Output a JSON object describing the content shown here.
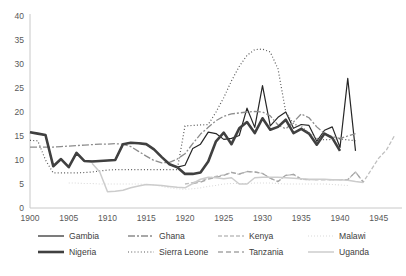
{
  "chart_data": {
    "type": "line",
    "title": "",
    "xlabel": "",
    "ylabel": "",
    "xlim": [
      1900,
      1948
    ],
    "ylim": [
      0,
      40
    ],
    "grid": false,
    "legend_position": "bottom",
    "xticks": [
      1900,
      1905,
      1910,
      1915,
      1920,
      1925,
      1930,
      1935,
      1940,
      1945
    ],
    "yticks": [
      0,
      5,
      10,
      15,
      20,
      25,
      30,
      35,
      40
    ],
    "series": [
      {
        "name": "Gambia",
        "color": "#262626",
        "width": 1.2,
        "dash": "",
        "x": [
          1900,
          1901,
          1902,
          1903,
          1904,
          1905,
          1906,
          1907,
          1908,
          1909,
          1910,
          1911,
          1912,
          1913,
          1914,
          1915,
          1916,
          1917,
          1918,
          1919,
          1920,
          1921,
          1922,
          1923,
          1924,
          1925,
          1926,
          1927,
          1928,
          1929,
          1930,
          1931,
          1932,
          1933,
          1934,
          1935,
          1936,
          1937,
          1938,
          1939,
          1940,
          1941,
          1942
        ],
        "values": [
          15.8,
          15.5,
          15.2,
          8.7,
          10.2,
          8.5,
          11.5,
          9.8,
          9.7,
          9.8,
          9.9,
          10.0,
          13.3,
          13.6,
          13.5,
          13.3,
          12.2,
          10.6,
          9.1,
          8.5,
          8.9,
          12.4,
          13.3,
          15.8,
          15.5,
          14.3,
          14.5,
          15.1,
          20.8,
          16.8,
          25.5,
          17.1,
          18.9,
          20.0,
          16.6,
          17.4,
          17.2,
          13.9,
          16.2,
          16.9,
          12.6,
          27.0,
          11.9
        ]
      },
      {
        "name": "Ghana",
        "color": "#8c8c8c",
        "width": 1.3,
        "dash": "7 2 2 2",
        "x": [
          1900,
          1901,
          1902,
          1903,
          1904,
          1905,
          1906,
          1907,
          1908,
          1909,
          1910,
          1911,
          1912,
          1913,
          1914,
          1915,
          1916,
          1917,
          1918,
          1919,
          1920,
          1921,
          1922,
          1923,
          1924,
          1925,
          1926,
          1927,
          1928,
          1929,
          1930,
          1931,
          1932,
          1933,
          1934,
          1935,
          1936,
          1937,
          1938,
          1939,
          1940,
          1941,
          1942
        ],
        "values": [
          12.7,
          12.7,
          12.7,
          12.7,
          12.8,
          12.9,
          13.0,
          13.1,
          13.2,
          13.3,
          13.3,
          13.4,
          13.3,
          12.8,
          11.8,
          10.8,
          9.9,
          9.4,
          9.5,
          10.2,
          11.3,
          13.4,
          15.4,
          16.8,
          18.2,
          19.1,
          19.6,
          19.8,
          20.0,
          20.1,
          20.0,
          19.2,
          17.3,
          16.5,
          17.9,
          19.6,
          18.8,
          16.9,
          15.5,
          14.9,
          14.5,
          15.0,
          15.5
        ]
      },
      {
        "name": "Kenya",
        "color": "#bfbfbf",
        "width": 1.3,
        "dash": "4 2",
        "x": [
          1920,
          1921,
          1922,
          1923,
          1924,
          1925,
          1926,
          1927,
          1928,
          1929,
          1930,
          1931,
          1932,
          1933,
          1934,
          1935,
          1936,
          1937,
          1938,
          1939,
          1940,
          1941,
          1942,
          1943,
          1944,
          1945,
          1946,
          1947
        ],
        "values": [
          5.0,
          5.3,
          5.6,
          6.2,
          6.6,
          6.9,
          7.4,
          7.0,
          7.6,
          7.5,
          7.2,
          6.2,
          5.5,
          6.8,
          7.0,
          6.0,
          5.9,
          5.9,
          5.9,
          5.9,
          5.9,
          5.9,
          7.5,
          5.4,
          7.9,
          10.4,
          12.1,
          15.0
        ]
      },
      {
        "name": "Malawi",
        "color": "#d9d9d9",
        "width": 1.1,
        "dash": "1 2",
        "x": [
          1905,
          1906,
          1907,
          1908,
          1909,
          1910,
          1911,
          1912,
          1913,
          1914,
          1915,
          1916,
          1917,
          1918,
          1919,
          1920,
          1921,
          1922,
          1923,
          1924,
          1925,
          1926,
          1927,
          1928,
          1929,
          1930,
          1931,
          1932,
          1933,
          1934,
          1935,
          1936,
          1937,
          1938,
          1939,
          1940,
          1941
        ],
        "values": [
          5.2,
          5.2,
          5.1,
          5.1,
          5.0,
          5.0,
          5.0,
          5.0,
          5.0,
          5.0,
          4.9,
          4.8,
          4.5,
          4.2,
          4.0,
          3.9,
          4.0,
          4.2,
          4.5,
          4.7,
          5.0,
          5.1,
          5.1,
          5.1,
          5.2,
          5.2,
          5.2,
          5.1,
          5.0,
          5.0,
          5.0,
          5.0,
          5.0,
          5.0,
          4.9,
          4.8,
          4.7
        ]
      },
      {
        "name": "Nigeria",
        "color": "#404040",
        "width": 2.6,
        "dash": "",
        "x": [
          1900,
          1901,
          1902,
          1903,
          1904,
          1905,
          1906,
          1907,
          1908,
          1909,
          1910,
          1911,
          1912,
          1913,
          1914,
          1915,
          1916,
          1917,
          1918,
          1919,
          1920,
          1921,
          1922,
          1923,
          1924,
          1925,
          1926,
          1927,
          1928,
          1929,
          1930,
          1931,
          1932,
          1933,
          1934,
          1935,
          1936,
          1937,
          1938,
          1939,
          1940
        ],
        "values": [
          15.8,
          15.5,
          15.2,
          8.7,
          10.2,
          8.5,
          11.5,
          9.8,
          9.7,
          9.8,
          9.9,
          10.0,
          13.3,
          13.6,
          13.5,
          13.3,
          12.2,
          10.6,
          9.1,
          8.5,
          7.1,
          7.1,
          7.4,
          9.7,
          13.9,
          15.7,
          13.3,
          16.6,
          17.9,
          15.6,
          18.7,
          16.3,
          16.9,
          18.4,
          15.6,
          16.5,
          15.5,
          13.2,
          15.5,
          14.6,
          11.9
        ]
      },
      {
        "name": "Sierra Leone",
        "color": "#595959",
        "width": 1.2,
        "dash": "1 2.2",
        "x": [
          1900,
          1901,
          1902,
          1903,
          1904,
          1905,
          1906,
          1907,
          1908,
          1909,
          1910,
          1911,
          1912,
          1913,
          1914,
          1915,
          1916,
          1917,
          1918,
          1919,
          1920,
          1921,
          1922,
          1923,
          1924,
          1925,
          1926,
          1927,
          1928,
          1929,
          1930,
          1931,
          1932,
          1933,
          1934,
          1935,
          1936,
          1937,
          1938,
          1939,
          1940,
          1941,
          1942
        ],
        "values": [
          14.1,
          14.0,
          10.0,
          7.3,
          7.3,
          7.3,
          7.3,
          7.4,
          7.5,
          7.7,
          7.9,
          8.0,
          8.0,
          8.0,
          8.0,
          8.0,
          8.0,
          8.0,
          8.0,
          8.0,
          17.1,
          17.2,
          17.3,
          17.4,
          20.0,
          23.0,
          26.5,
          29.5,
          31.8,
          33.0,
          33.1,
          32.5,
          29.0,
          20.0,
          17.5,
          17.0,
          15.6,
          14.5,
          14.2,
          14.3,
          14.4,
          14.2,
          14.0
        ]
      },
      {
        "name": "Tanzania",
        "color": "#a6a6a6",
        "width": 1.3,
        "dash": "5 3",
        "x": [
          1921,
          1922,
          1923,
          1924,
          1925,
          1926,
          1927,
          1928,
          1929,
          1930,
          1931,
          1932,
          1933,
          1934,
          1935,
          1936,
          1937,
          1938,
          1939,
          1940,
          1941,
          1942,
          1943
        ],
        "values": [
          5.1,
          5.4,
          6.0,
          6.4,
          6.8,
          7.4,
          7.1,
          7.6,
          7.5,
          7.2,
          6.2,
          5.5,
          6.8,
          7.0,
          6.0,
          5.9,
          5.9,
          5.9,
          5.9,
          5.9,
          5.9,
          7.5,
          5.4
        ]
      },
      {
        "name": "Uganda",
        "color": "#cccccc",
        "width": 1.5,
        "dash": "",
        "x": [
          1908,
          1909,
          1910,
          1911,
          1912,
          1913,
          1914,
          1915,
          1916,
          1917,
          1918,
          1919,
          1920,
          1921,
          1922,
          1923,
          1924,
          1925,
          1926,
          1927,
          1928,
          1929,
          1930,
          1931,
          1932,
          1933,
          1934,
          1935,
          1936,
          1937,
          1938,
          1939,
          1940,
          1941,
          1942,
          1943
        ],
        "values": [
          9.3,
          7.5,
          3.4,
          3.5,
          3.7,
          4.2,
          4.6,
          4.9,
          4.8,
          4.7,
          4.5,
          4.3,
          4.2,
          5.1,
          6.0,
          6.4,
          6.3,
          6.1,
          6.3,
          5.0,
          5.0,
          6.3,
          6.4,
          6.4,
          6.4,
          6.3,
          6.2,
          6.1,
          6.0,
          6.0,
          6.0,
          5.9,
          5.9,
          5.8,
          5.5,
          5.3
        ]
      }
    ]
  },
  "legend": {
    "row1": [
      {
        "label": "Gambia",
        "key": "gambia"
      },
      {
        "label": "Ghana",
        "key": "ghana"
      },
      {
        "label": "Kenya",
        "key": "kenya"
      },
      {
        "label": "Malawi",
        "key": "malawi"
      }
    ],
    "row2": [
      {
        "label": "Nigeria",
        "key": "nigeria"
      },
      {
        "label": "Sierra Leone",
        "key": "sierra-leone"
      },
      {
        "label": "Tanzania",
        "key": "tanzania"
      },
      {
        "label": "Uganda",
        "key": "uganda"
      }
    ]
  },
  "caption": ""
}
